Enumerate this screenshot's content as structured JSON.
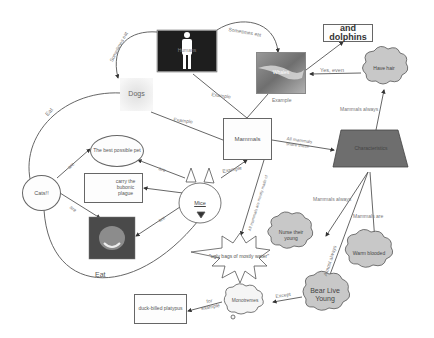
{
  "diagram": {
    "type": "concept-map",
    "nodes": {
      "humans": {
        "label": "Humans",
        "shape": "photo-person"
      },
      "whales": {
        "label": "Whales",
        "shape": "photo-whale"
      },
      "and_dolphins": {
        "label": "and dolphins",
        "shape": "rect"
      },
      "have_hair": {
        "label": "Have hair",
        "shape": "cloud"
      },
      "dogs": {
        "label": "Dogs",
        "shape": "photo-dog"
      },
      "mammals": {
        "label": "Mammals",
        "shape": "rect"
      },
      "characteristics": {
        "label": "Characteristics",
        "shape": "trapezoid"
      },
      "best_pet": {
        "label": "The best possible pet",
        "shape": "ellipse"
      },
      "plague": {
        "label": "carry the bubonic plague",
        "shape": "rect-with-warning-icon"
      },
      "cats": {
        "label": "Cats!!",
        "shape": "ellipse"
      },
      "mice": {
        "label": "Mice",
        "shape": "mouse-face"
      },
      "cute_photo": {
        "label": "",
        "shape": "photo-face"
      },
      "ugly_bags": {
        "label": "\"ugly bags of mostly water\"",
        "shape": "starburst"
      },
      "nurse": {
        "label": "Nurse their young",
        "shape": "cloud"
      },
      "warm": {
        "label": "Warm blooded",
        "shape": "cloud"
      },
      "bear_live": {
        "label": "Bear Live Young",
        "shape": "cloud"
      },
      "monotremes": {
        "label": "Monotremes",
        "shape": "callout-cloud"
      },
      "platypus": {
        "label": "duck-billed platypus",
        "shape": "rect"
      }
    },
    "edges": [
      {
        "from": "humans",
        "to": "dogs",
        "label": "Sometimes eat"
      },
      {
        "from": "humans",
        "to": "whales",
        "label": "Sometimes eat"
      },
      {
        "from": "mammals",
        "to": "humans",
        "label": "Example"
      },
      {
        "from": "mammals",
        "to": "whales",
        "label": "Example"
      },
      {
        "from": "whales",
        "to": "and_dolphins",
        "label": ""
      },
      {
        "from": "have_hair",
        "to": "whales",
        "label": "Yes, even"
      },
      {
        "from": "characteristics",
        "to": "have_hair",
        "label": "Mammals always"
      },
      {
        "from": "mammals",
        "to": "dogs",
        "label": "Example"
      },
      {
        "from": "dogs",
        "to": "cats",
        "label": "Eat"
      },
      {
        "from": "mammals",
        "to": "characteristics",
        "label": "All mammals share these"
      },
      {
        "from": "mice",
        "to": "mammals",
        "label": "Example"
      },
      {
        "from": "mammals",
        "to": "ugly_bags",
        "label": "All mammals are mostly made of"
      },
      {
        "from": "cats",
        "to": "best_pet",
        "label": "are"
      },
      {
        "from": "cats",
        "to": "cute_photo",
        "label": "are"
      },
      {
        "from": "mice",
        "to": "best_pet",
        "label": "are"
      },
      {
        "from": "mice",
        "to": "plague",
        "label": ""
      },
      {
        "from": "mice",
        "to": "cute_photo",
        "label": "are"
      },
      {
        "from": "cats",
        "to": "mice",
        "label": "Eat"
      },
      {
        "from": "characteristics",
        "to": "nurse",
        "label": "Mammals always"
      },
      {
        "from": "characteristics",
        "to": "warm",
        "label": "Mammals are"
      },
      {
        "from": "characteristics",
        "to": "bear_live",
        "label": "Almost always"
      },
      {
        "from": "bear_live",
        "to": "monotremes",
        "label": "Except"
      },
      {
        "from": "monotremes",
        "to": "platypus",
        "label": "for example"
      }
    ]
  },
  "colors": {
    "line": "#555555",
    "cloud_fill": "#c8c8c8",
    "trapezoid_fill": "#6e6e6e",
    "box_fill": "#fdfdfd"
  }
}
